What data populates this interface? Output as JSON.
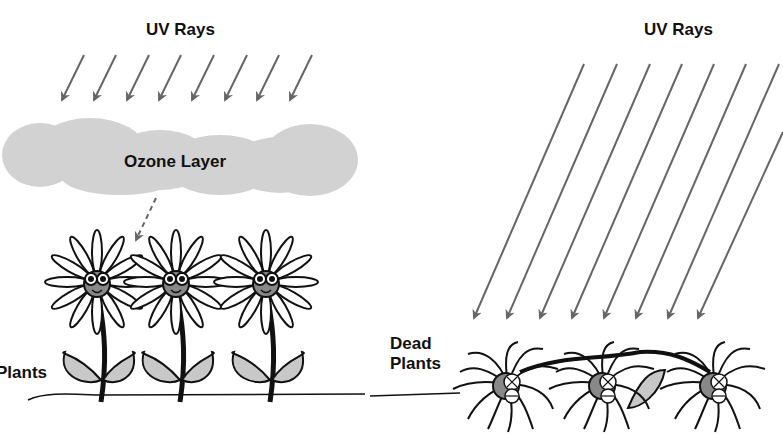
{
  "left_panel": {
    "uv_label": "UV Rays",
    "ozone_label": "Ozone Layer",
    "plants_label": "Plants",
    "arrow_count": 8,
    "flower_count": 3
  },
  "right_panel": {
    "uv_label": "UV Rays",
    "dead_plants_label_line1": "Dead",
    "dead_plants_label_line2": "Plants",
    "arrow_count": 8,
    "flower_count": 3
  },
  "colors": {
    "arrow": "#666666",
    "ozone": "#d2d2d2",
    "leaf": "#c8c8c8",
    "outline": "#111111"
  }
}
